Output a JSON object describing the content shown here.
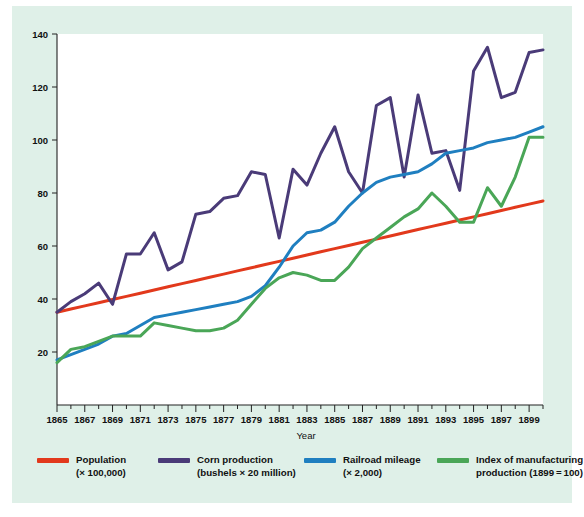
{
  "figure": {
    "background": "#dff0e8",
    "plot_background": "#ffffff"
  },
  "axis": {
    "xlabel": "Year",
    "ylabel": "",
    "y_ticks": [
      20,
      40,
      60,
      80,
      100,
      120,
      140
    ],
    "x_ticks_major": [
      1865,
      1867,
      1869,
      1871,
      1873,
      1875,
      1877,
      1879,
      1881,
      1883,
      1885,
      1887,
      1889,
      1891,
      1893,
      1895,
      1897,
      1899
    ],
    "x_ticks_minor": [
      1866,
      1868,
      1870,
      1872,
      1874,
      1876,
      1878,
      1880,
      1882,
      1884,
      1886,
      1888,
      1890,
      1892,
      1894,
      1896,
      1898,
      1900
    ]
  },
  "legend": {
    "position": "below-axis",
    "items": [
      {
        "name": "population",
        "line1": "Population",
        "line2": "(× 100,000)",
        "color": "#e2391c"
      },
      {
        "name": "corn-production",
        "line1": "Corn production",
        "line2": "(bushels × 20 million)",
        "color": "#4a3b78"
      },
      {
        "name": "railroad-mileage",
        "line1": "Railroad mileage",
        "line2": "(× 2,000)",
        "color": "#1f7fc0"
      },
      {
        "name": "index-of-manufacturing",
        "line1": "Index of manufacturing",
        "line2": "production (1899 = 100)",
        "color": "#4aa койка"
      }
    ]
  },
  "chart_data": {
    "type": "line",
    "title": "",
    "xlabel": "Year",
    "ylabel": "",
    "xlim": [
      1865,
      1900
    ],
    "ylim": [
      0,
      140
    ],
    "grid": false,
    "legend_position": "bottom",
    "x": [
      1865,
      1866,
      1867,
      1868,
      1869,
      1870,
      1871,
      1872,
      1873,
      1874,
      1875,
      1876,
      1877,
      1878,
      1879,
      1880,
      1881,
      1882,
      1883,
      1884,
      1885,
      1886,
      1887,
      1888,
      1889,
      1890,
      1891,
      1892,
      1893,
      1894,
      1895,
      1896,
      1897,
      1898,
      1899,
      1900
    ],
    "series": [
      {
        "name": "Population",
        "label": "Population (× 100,000)",
        "color": "#e2391c",
        "values": [
          35.0,
          36.2,
          37.4,
          38.6,
          39.8,
          41.0,
          42.2,
          43.4,
          44.6,
          45.8,
          47.0,
          48.2,
          49.4,
          50.6,
          51.8,
          53.0,
          54.2,
          55.4,
          56.6,
          57.8,
          59.0,
          60.2,
          61.4,
          62.6,
          63.8,
          65.0,
          66.2,
          67.4,
          68.6,
          69.8,
          71.0,
          72.2,
          73.4,
          74.6,
          75.8,
          77.0
        ]
      },
      {
        "name": "Corn production",
        "label": "Corn production (bushels × 20 million)",
        "color": "#4a3b78",
        "values": [
          35,
          39,
          42,
          46,
          38,
          57,
          57,
          65,
          51,
          54,
          72,
          73,
          78,
          79,
          88,
          87,
          63,
          89,
          83,
          95,
          105,
          88,
          80,
          113,
          116,
          86,
          117,
          95,
          96,
          81,
          126,
          135,
          116,
          118,
          133,
          134
        ]
      },
      {
        "name": "Railroad mileage",
        "label": "Railroad mileage (× 2,000)",
        "color": "#1f7fc0",
        "values": [
          17,
          19,
          21,
          23,
          26,
          27,
          30,
          33,
          34,
          35,
          36,
          37,
          38,
          39,
          41,
          45,
          52,
          60,
          65,
          66,
          69,
          75,
          80,
          84,
          86,
          87,
          88,
          91,
          95,
          96,
          97,
          99,
          100,
          101,
          103,
          105
        ]
      },
      {
        "name": "Index of manufacturing production",
        "label": "Index of manufacturing production (1899=100)",
        "color": "#4aa657",
        "values": [
          16,
          21,
          22,
          24,
          26,
          26,
          26,
          31,
          30,
          29,
          28,
          28,
          29,
          32,
          38,
          44,
          48,
          50,
          49,
          47,
          47,
          52,
          59,
          63,
          67,
          71,
          74,
          80,
          75,
          69,
          69,
          82,
          75,
          86,
          101,
          101
        ]
      }
    ]
  }
}
